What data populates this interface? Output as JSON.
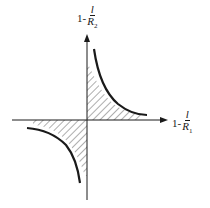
{
  "diagram": {
    "type": "stability-diagram",
    "y_axis_label": {
      "prefix": "1-",
      "numerator": "l",
      "denominator": "R",
      "subscript": "2"
    },
    "x_axis_label": {
      "prefix": "1-",
      "numerator": "l",
      "denominator": "R",
      "subscript": "1"
    },
    "regions": [
      "quadrant-1-hatched",
      "quadrant-3-hatched"
    ],
    "curves": [
      "hyperbola-quadrant-1",
      "hyperbola-quadrant-3"
    ],
    "colors": {
      "line": "#1a1a1a",
      "background": "#ffffff"
    }
  }
}
